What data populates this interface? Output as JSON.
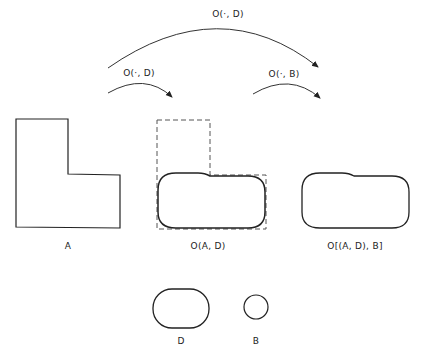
{
  "arrows": {
    "big": {
      "label": "O(·, D)"
    },
    "small_left": {
      "label": "O(·, D)"
    },
    "small_right": {
      "label": "O(·, B)"
    }
  },
  "shapes": {
    "A": {
      "label": "A"
    },
    "opening_AD": {
      "label": "O(A, D)"
    },
    "opening_ADB": {
      "label": "O[(A, D), B]"
    },
    "D": {
      "label": "D"
    },
    "B": {
      "label": "B"
    }
  },
  "colors": {
    "stroke": "#222222",
    "dashed": "#555555"
  }
}
